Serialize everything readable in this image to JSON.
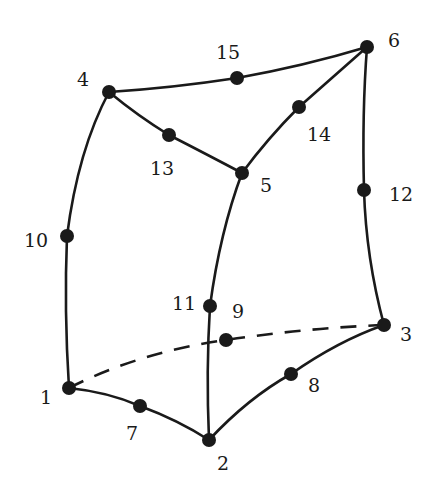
{
  "colors": {
    "stroke": "#1a1a1a",
    "background": "#ffffff"
  },
  "nodes": [
    {
      "id": "1",
      "label": "1",
      "x": 69,
      "y": 388,
      "lx": 40,
      "ly": 404
    },
    {
      "id": "2",
      "label": "2",
      "x": 209,
      "y": 440,
      "lx": 217,
      "ly": 470
    },
    {
      "id": "3",
      "label": "3",
      "x": 384,
      "y": 325,
      "lx": 400,
      "ly": 341
    },
    {
      "id": "4",
      "label": "4",
      "x": 109,
      "y": 92,
      "lx": 77,
      "ly": 86
    },
    {
      "id": "5",
      "label": "5",
      "x": 242,
      "y": 173,
      "lx": 260,
      "ly": 192
    },
    {
      "id": "6",
      "label": "6",
      "x": 367,
      "y": 47,
      "lx": 388,
      "ly": 47
    },
    {
      "id": "7",
      "label": "7",
      "x": 140,
      "y": 406,
      "lx": 126,
      "ly": 440
    },
    {
      "id": "8",
      "label": "8",
      "x": 291,
      "y": 374,
      "lx": 308,
      "ly": 392
    },
    {
      "id": "9",
      "label": "9",
      "x": 226,
      "y": 340,
      "lx": 232,
      "ly": 318
    },
    {
      "id": "10",
      "label": "10",
      "x": 67,
      "y": 236,
      "lx": 24,
      "ly": 247
    },
    {
      "id": "11",
      "label": "11",
      "x": 210,
      "y": 306,
      "lx": 172,
      "ly": 310
    },
    {
      "id": "12",
      "label": "12",
      "x": 364,
      "y": 190,
      "lx": 389,
      "ly": 201
    },
    {
      "id": "13",
      "label": "13",
      "x": 169,
      "y": 135,
      "lx": 150,
      "ly": 175
    },
    {
      "id": "14",
      "label": "14",
      "x": 299,
      "y": 107,
      "lx": 307,
      "ly": 141
    },
    {
      "id": "15",
      "label": "15",
      "x": 237,
      "y": 78,
      "lx": 216,
      "ly": 59
    }
  ],
  "edges": [
    {
      "name": "edge-1-7-2",
      "d": "M69,388 Q108,392 140,406 Q178,420 209,440",
      "hidden": false
    },
    {
      "name": "edge-2-8-3",
      "d": "M209,440 Q248,398 291,374 Q338,341 384,325",
      "hidden": false
    },
    {
      "name": "edge-1-9-3",
      "d": "M69,388 Q140,352 226,340 Q306,328 384,325",
      "hidden": true
    },
    {
      "name": "edge-4-15-6",
      "d": "M109,92 Q172,88 237,78 Q304,66 367,47",
      "hidden": false
    },
    {
      "name": "edge-4-13-5",
      "d": "M109,92 Q138,116 169,135 Q208,155 242,173",
      "hidden": false
    },
    {
      "name": "edge-5-14-6",
      "d": "M242,173 Q268,138 299,107 Q334,76 367,47",
      "hidden": false
    },
    {
      "name": "edge-1-10-4",
      "d": "M69,388 Q64,310 67,236 Q78,150 109,92",
      "hidden": false
    },
    {
      "name": "edge-2-11-5",
      "d": "M209,440 Q206,370 210,306 Q220,232 242,173",
      "hidden": false
    },
    {
      "name": "edge-3-12-6",
      "d": "M384,325 Q366,258 364,190 Q362,112 367,47",
      "hidden": false
    }
  ]
}
